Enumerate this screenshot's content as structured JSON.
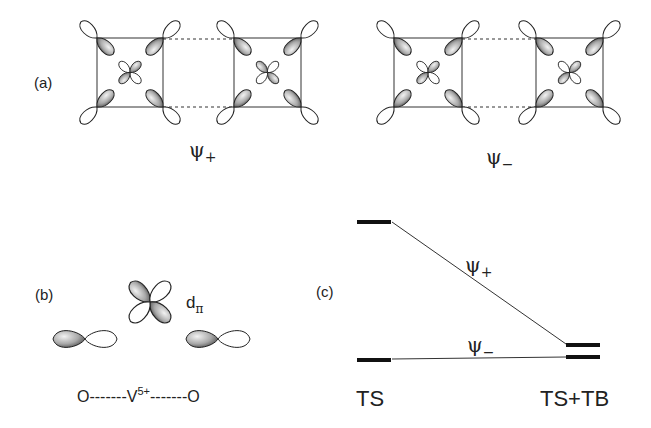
{
  "panels": {
    "a": {
      "label": "(a)",
      "states": [
        {
          "symbol": "ψ",
          "subscript": "+"
        },
        {
          "symbol": "ψ",
          "subscript": "−"
        }
      ]
    },
    "b": {
      "label": "(b)",
      "orbital_label": "d",
      "orbital_sub": "π",
      "chain": {
        "left": "O",
        "center": "V",
        "center_sup": "5+",
        "right": "O",
        "bond": "-------"
      }
    },
    "c": {
      "label": "(c)",
      "left_label": "TS",
      "right_label": "TS+TB",
      "upper_state": {
        "symbol": "ψ",
        "subscript": "+"
      },
      "lower_state": {
        "symbol": "ψ",
        "subscript": "−"
      }
    }
  },
  "colors": {
    "ink": "#222222",
    "shade": "#9a9a9a"
  }
}
